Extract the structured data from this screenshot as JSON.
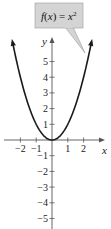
{
  "chart_data": {
    "type": "line",
    "title": "",
    "function_label": "f(x) = x²",
    "function_parts": {
      "lhs": "f(x) = x",
      "exp": "2"
    },
    "xlabel": "x",
    "ylabel": "y",
    "xlim": [
      -2.5,
      2.5
    ],
    "ylim": [
      -5.5,
      6
    ],
    "x_ticks": [
      -2,
      -1,
      1,
      2
    ],
    "y_ticks": [
      5,
      4,
      3,
      2,
      1,
      -1,
      -2,
      -3,
      -4,
      -5
    ],
    "x_tick_labels": [
      "−2",
      "−1",
      "1",
      "2"
    ],
    "y_tick_labels": [
      "5",
      "4",
      "3",
      "2",
      "1",
      "−1",
      "−2",
      "−3",
      "−4",
      "−5"
    ],
    "series": [
      {
        "name": "f(x) = x^2",
        "x": [
          -2.5,
          -2,
          -1.5,
          -1,
          -0.5,
          0,
          0.5,
          1,
          1.5,
          2,
          2.5
        ],
        "y": [
          6.25,
          4,
          2.25,
          1,
          0.25,
          0,
          0.25,
          1,
          2.25,
          4,
          6.25
        ]
      }
    ],
    "grid": false,
    "legend": "callout box above right branch"
  },
  "colors": {
    "curve": "#1a1a1a",
    "axis": "#555555",
    "callout_fill": "#d4d4d4",
    "callout_border": "#9a9a9a"
  }
}
